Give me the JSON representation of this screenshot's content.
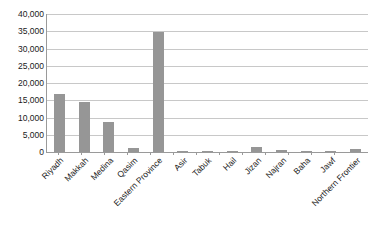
{
  "chart_data": {
    "type": "bar",
    "title": "",
    "xlabel": "",
    "ylabel": "",
    "ylim": [
      0,
      40000
    ],
    "ytick_labels": [
      "40,000",
      "35,000",
      "30,000",
      "25,000",
      "20,000",
      "15,000",
      "10,000",
      "5,000",
      "0"
    ],
    "ytick_values": [
      40000,
      35000,
      30000,
      25000,
      20000,
      15000,
      10000,
      5000,
      0
    ],
    "grid": true,
    "legend": "none",
    "bar_color": "#969696",
    "gridline_color": "#c8c8c8",
    "axis_color": "#9a9a9a",
    "text_color": "#1a1a1a",
    "categories": [
      "Riyadh",
      "Makkah",
      "Medina",
      "Qasim",
      "Eastern Province",
      "Asir",
      "Tabuk",
      "Hail",
      "Jizan",
      "Najran",
      "Baha",
      "Jawf",
      "Northern Frontier"
    ],
    "values": [
      16800,
      14600,
      8700,
      1200,
      34900,
      400,
      300,
      200,
      1500,
      600,
      150,
      100,
      1000
    ]
  }
}
